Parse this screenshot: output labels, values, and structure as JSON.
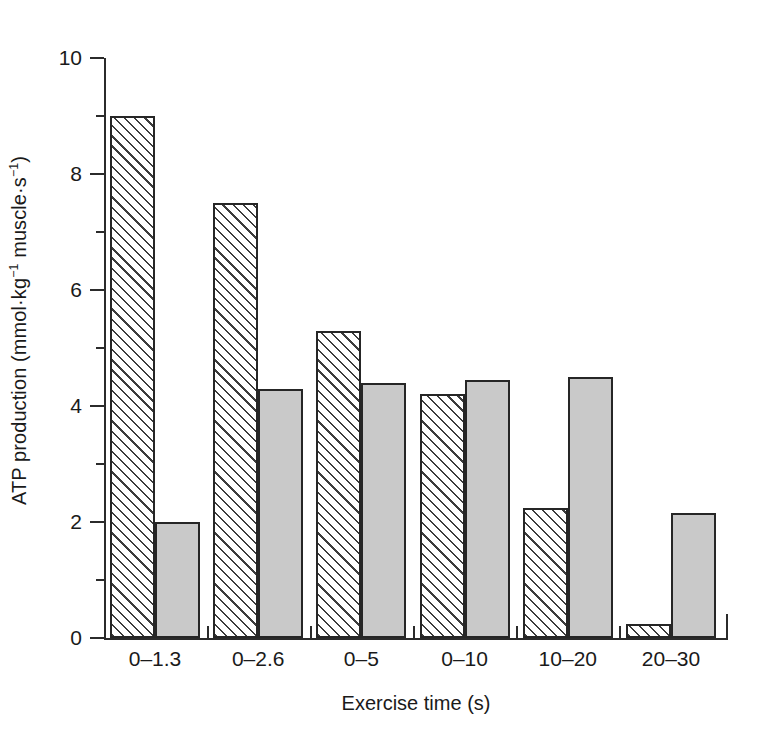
{
  "chart_data": {
    "type": "bar",
    "title": "",
    "subtitle": "",
    "xlabel": "Exercise time (s)",
    "ylabel": "ATP production (mmol·kg⁻¹ muscle·s⁻¹)",
    "ylabel_parts": {
      "prefix": "ATP production (mmol·kg",
      "sup1": "−1",
      "middle": " muscle·s",
      "sup2": "−1",
      "suffix": ")"
    },
    "categories": [
      "0–1.3",
      "0–2.6",
      "0–5",
      "0–10",
      "10–20",
      "20–30"
    ],
    "ylim": [
      0,
      10
    ],
    "ytick_labels": [
      "0",
      "2",
      "4",
      "6",
      "8",
      "10"
    ],
    "ytick_values": [
      0,
      2,
      4,
      6,
      8,
      10
    ],
    "yminor_values": [
      1,
      3,
      5,
      7,
      9
    ],
    "grid": false,
    "legend": "none",
    "series": [
      {
        "name": "series-hatched",
        "fill": "diagonal-hatch",
        "color": "#ffffff",
        "values": [
          9.0,
          7.5,
          5.3,
          4.2,
          2.25,
          0.25
        ]
      },
      {
        "name": "series-gray",
        "fill": "solid-gray",
        "color": "#c9c9c9",
        "values": [
          2.0,
          4.3,
          4.4,
          4.45,
          4.5,
          2.15
        ]
      }
    ]
  }
}
